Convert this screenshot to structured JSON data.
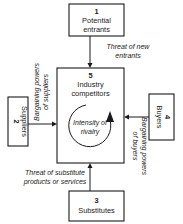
{
  "forces": {
    "entrants": {
      "number": "1",
      "line1": "Potential",
      "line2": "entrants"
    },
    "suppliers": {
      "number": "2",
      "line1": "Suppliers"
    },
    "substitutes": {
      "number": "3",
      "line1": "Substitutes"
    },
    "buyers": {
      "number": "4",
      "line1": "Buyers"
    },
    "competitors": {
      "number": "5",
      "line1": "Industry",
      "line2": "competitors"
    }
  },
  "rivalry": {
    "line1": "Intensity of",
    "line2": "rivalry"
  },
  "arrow_labels": {
    "new_entrants": {
      "line1": "Threat of new",
      "line2": "entrants"
    },
    "suppliers": {
      "line1": "Bargaining powers",
      "line2": "of suppliers"
    },
    "buyers": {
      "line1": "Bargaining powers",
      "line2": "of buyers"
    },
    "substitutes": {
      "line1": "Threat of substitute",
      "line2": "products or services"
    }
  },
  "colors": {
    "ink": "#1a1a1a",
    "background": "#ffffff"
  }
}
